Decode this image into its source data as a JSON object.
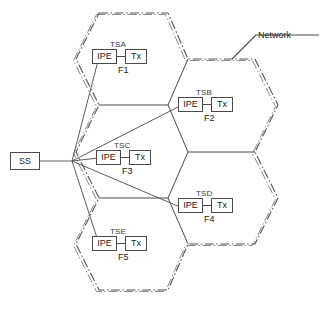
{
  "diagram": {
    "network_label": "Network",
    "ss_node": {
      "label": "SS"
    },
    "box_labels": {
      "ipe": "IPE",
      "tx": "Tx"
    },
    "cells": [
      {
        "id": "cell-f1",
        "site": "TSA",
        "frequency": "F1",
        "ipe": "IPE",
        "tx": "Tx"
      },
      {
        "id": "cell-f2",
        "site": "TSB",
        "frequency": "F2",
        "ipe": "IPE",
        "tx": "Tx"
      },
      {
        "id": "cell-f3",
        "site": "TSC",
        "frequency": "F3",
        "ipe": "IPE",
        "tx": "Tx"
      },
      {
        "id": "cell-f4",
        "site": "TSD",
        "frequency": "F4",
        "ipe": "IPE",
        "tx": "Tx"
      },
      {
        "id": "cell-f5",
        "site": "TSE",
        "frequency": "F5",
        "ipe": "IPE",
        "tx": "Tx"
      }
    ],
    "colors": {
      "line": "#4a4a4a",
      "boundary": "#555555",
      "text": "#1a1a1a",
      "label": "#3a3a3a",
      "background": "#ffffff"
    }
  }
}
